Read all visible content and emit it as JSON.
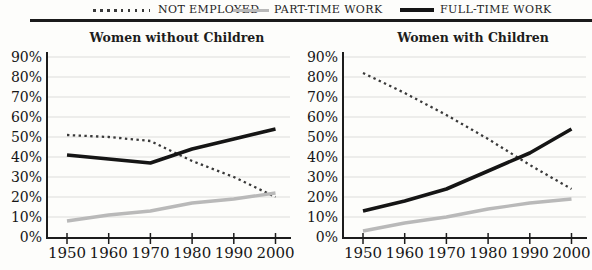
{
  "legend": {
    "items": [
      {
        "label": "NOT EMPLOYED",
        "style": "dotted",
        "color": "#3a3a3a"
      },
      {
        "label": "PART-TIME WORK",
        "style": "solid",
        "color": "#b9b9b9"
      },
      {
        "label": "FULL-TIME WORK",
        "style": "solid",
        "color": "#151515"
      }
    ]
  },
  "chart_data": [
    {
      "type": "line",
      "title": "Women without Children",
      "x": [
        1950,
        1960,
        1970,
        1980,
        1990,
        2000
      ],
      "x_tick_labels": [
        "1950",
        "1960",
        "1970",
        "1980",
        "1990",
        "2000"
      ],
      "y_tick_labels": [
        "0%",
        "10%",
        "20%",
        "30%",
        "40%",
        "50%",
        "60%",
        "70%",
        "80%",
        "90%"
      ],
      "ylim": [
        0,
        90
      ],
      "grid": true,
      "legend_position": "top-shared",
      "series": [
        {
          "name": "NOT EMPLOYED",
          "style": "dotted",
          "color": "#3a3a3a",
          "values": [
            51,
            50,
            48,
            38,
            30,
            20
          ]
        },
        {
          "name": "PART-TIME WORK",
          "style": "solid",
          "color": "#b9b9b9",
          "values": [
            8,
            11,
            13,
            17,
            19,
            22
          ]
        },
        {
          "name": "FULL-TIME WORK",
          "style": "solid",
          "color": "#151515",
          "values": [
            41,
            39,
            37,
            44,
            49,
            54
          ]
        }
      ]
    },
    {
      "type": "line",
      "title": "Women with Children",
      "x": [
        1950,
        1960,
        1970,
        1980,
        1990,
        2000
      ],
      "x_tick_labels": [
        "1950",
        "1960",
        "1970",
        "1980",
        "1990",
        "2000"
      ],
      "y_tick_labels": [
        "0%",
        "10%",
        "20%",
        "30%",
        "40%",
        "50%",
        "60%",
        "70%",
        "80%",
        "90%"
      ],
      "ylim": [
        0,
        90
      ],
      "grid": true,
      "legend_position": "top-shared",
      "series": [
        {
          "name": "NOT EMPLOYED",
          "style": "dotted",
          "color": "#3a3a3a",
          "values": [
            82,
            72,
            61,
            49,
            36,
            24
          ]
        },
        {
          "name": "PART-TIME WORK",
          "style": "solid",
          "color": "#b9b9b9",
          "values": [
            3,
            7,
            10,
            14,
            17,
            19
          ]
        },
        {
          "name": "FULL-TIME WORK",
          "style": "solid",
          "color": "#151515",
          "values": [
            13,
            18,
            24,
            33,
            42,
            54
          ]
        }
      ]
    }
  ]
}
